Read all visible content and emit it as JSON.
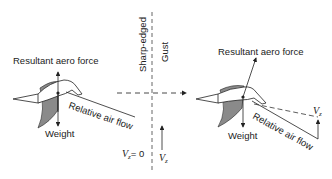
{
  "left_panel": {
    "force_label": "Resultant aero force",
    "weight_label": "Weight",
    "airflow_label": "Relative air flow"
  },
  "center": {
    "gust_label_line1": "Sharp-edged",
    "gust_label_line2": "Gust",
    "vz_zero_label": "V",
    "vz_zero_sub": "z",
    "vz_zero_value": "= 0",
    "vz_label": "V",
    "vz_sub": "z"
  },
  "right_panel": {
    "force_label": "Resultant aero force",
    "weight_label": "Weight",
    "airflow_label": "Relative air flow",
    "vz_label": "V",
    "vz_sub": "z"
  },
  "colors": {
    "ink": "#222222",
    "wing_fill": "#8a8a8a"
  }
}
